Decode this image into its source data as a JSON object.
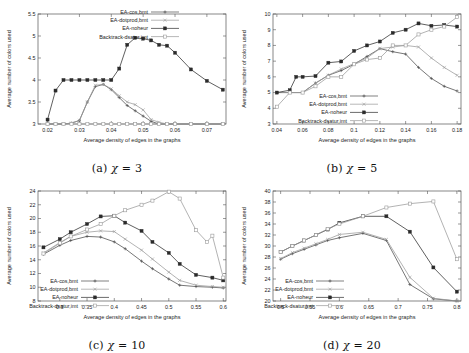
{
  "figure": {
    "panels": [
      {
        "id": "a",
        "caption_prefix": "(a)",
        "caption_chi": "χ",
        "caption_eq": "= 3"
      },
      {
        "id": "b",
        "caption_prefix": "(b)",
        "caption_chi": "χ",
        "caption_eq": "= 5"
      },
      {
        "id": "c",
        "caption_prefix": "(c)",
        "caption_chi": "χ",
        "caption_eq": "= 10"
      },
      {
        "id": "d",
        "caption_prefix": "(d)",
        "caption_chi": "χ",
        "caption_eq": "= 20"
      }
    ]
  },
  "chart_data": [
    {
      "id": "a",
      "type": "line",
      "title": "",
      "xlabel": "Average density of edges in the graphs",
      "ylabel": "Average number of colors used",
      "xlim": [
        0.017,
        0.076
      ],
      "ylim": [
        3,
        5.5
      ],
      "xticks": [
        0.02,
        0.03,
        0.04,
        0.05,
        0.06,
        0.07
      ],
      "xtick_labels": [
        "0.02",
        "0.03",
        "0.04",
        "0.05",
        "0.06",
        "0.07"
      ],
      "yticks": [
        3,
        3.5,
        4,
        4.5,
        5,
        5.5
      ],
      "ytick_labels": [
        "3",
        "3.5",
        "4",
        "4.5",
        "5",
        "5.5"
      ],
      "grid": false,
      "legend_position": "top-right",
      "series": [
        {
          "name": "EA-cos,bmt",
          "marker": "plus",
          "color": "#4a4a4a",
          "x": [
            0.02,
            0.0225,
            0.025,
            0.0275,
            0.03,
            0.0325,
            0.035,
            0.0375,
            0.04,
            0.0425,
            0.045,
            0.0475,
            0.05,
            0.0525,
            0.055,
            0.0575,
            0.06,
            0.065,
            0.07,
            0.075
          ],
          "y": [
            3.0,
            3.0,
            3.0,
            3.02,
            3.08,
            3.5,
            3.85,
            3.9,
            3.78,
            3.6,
            3.42,
            3.3,
            3.18,
            3.06,
            3.0,
            3.0,
            3.0,
            3.0,
            3.0,
            3.0
          ]
        },
        {
          "name": "EA-dotprod,bmt",
          "marker": "cross",
          "color": "#9a9a9a",
          "x": [
            0.02,
            0.0225,
            0.025,
            0.0275,
            0.03,
            0.0325,
            0.035,
            0.0375,
            0.04,
            0.0425,
            0.045,
            0.0475,
            0.05,
            0.0525,
            0.055,
            0.0575,
            0.06,
            0.065,
            0.07,
            0.075
          ],
          "y": [
            3.0,
            3.0,
            3.0,
            3.02,
            3.08,
            3.5,
            3.88,
            3.9,
            3.8,
            3.64,
            3.5,
            3.44,
            3.32,
            3.1,
            3.04,
            3.0,
            3.0,
            3.0,
            3.0,
            3.0
          ]
        },
        {
          "name": "EA-noheur",
          "marker": "filled-square",
          "color": "#2b2b2b",
          "x": [
            0.02,
            0.0225,
            0.025,
            0.0275,
            0.03,
            0.0325,
            0.035,
            0.0375,
            0.04,
            0.0425,
            0.045,
            0.0475,
            0.05,
            0.0525,
            0.055,
            0.0575,
            0.06,
            0.065,
            0.07,
            0.075
          ],
          "y": [
            3.1,
            3.76,
            4.0,
            4.0,
            4.0,
            4.0,
            4.0,
            4.0,
            4.0,
            4.26,
            4.8,
            4.96,
            4.94,
            4.9,
            4.8,
            4.78,
            4.62,
            4.24,
            3.98,
            3.78
          ]
        },
        {
          "name": "Backtrack-dsatur,imt",
          "marker": "open-square",
          "color": "#9a9a9a",
          "x": [
            0.02,
            0.0225,
            0.025,
            0.0275,
            0.03,
            0.0325,
            0.035,
            0.0375,
            0.04,
            0.0425,
            0.045,
            0.0475,
            0.05,
            0.0525,
            0.055,
            0.0575,
            0.06,
            0.065,
            0.07,
            0.075
          ],
          "y": [
            3.0,
            3.0,
            3.0,
            3.0,
            3.0,
            3.0,
            3.0,
            3.0,
            3.0,
            3.0,
            3.0,
            3.0,
            3.0,
            3.0,
            3.0,
            3.0,
            3.0,
            3.0,
            3.0,
            3.0
          ]
        }
      ]
    },
    {
      "id": "b",
      "type": "line",
      "title": "",
      "xlabel": "Average density of edges in the graphs",
      "ylabel": "Average number of colors used",
      "xlim": [
        0.037,
        0.183
      ],
      "ylim": [
        3,
        10
      ],
      "xticks": [
        0.04,
        0.06,
        0.08,
        0.1,
        0.12,
        0.14,
        0.16,
        0.18
      ],
      "xtick_labels": [
        "0.04",
        "0.06",
        "0.08",
        "0.1",
        "0.12",
        "0.14",
        "0.16",
        "0.18"
      ],
      "yticks": [
        3,
        4,
        5,
        6,
        7,
        8,
        9,
        10
      ],
      "ytick_labels": [
        "3",
        "4",
        "5",
        "6",
        "7",
        "8",
        "9",
        "10"
      ],
      "grid": false,
      "legend_position": "bottom-center",
      "series": [
        {
          "name": "EA-cos,bmt",
          "marker": "plus",
          "color": "#4a4a4a",
          "x": [
            0.04,
            0.05,
            0.06,
            0.07,
            0.08,
            0.09,
            0.1,
            0.11,
            0.12,
            0.13,
            0.14,
            0.15,
            0.16,
            0.17,
            0.18
          ],
          "y": [
            5.0,
            5.0,
            5.0,
            5.6,
            6.1,
            6.4,
            6.8,
            7.3,
            7.8,
            7.6,
            7.45,
            6.6,
            5.9,
            5.4,
            5.1
          ]
        },
        {
          "name": "EA-dotprod,bmt",
          "marker": "cross",
          "color": "#9a9a9a",
          "x": [
            0.04,
            0.05,
            0.06,
            0.07,
            0.08,
            0.09,
            0.1,
            0.11,
            0.12,
            0.13,
            0.14,
            0.15,
            0.16,
            0.17,
            0.18
          ],
          "y": [
            5.0,
            5.0,
            5.0,
            5.6,
            6.1,
            6.5,
            6.85,
            7.2,
            7.8,
            7.9,
            8.0,
            7.9,
            7.2,
            6.6,
            6.1
          ]
        },
        {
          "name": "EA-noheur",
          "marker": "filled-square",
          "color": "#2b2b2b",
          "x": [
            0.04,
            0.05,
            0.055,
            0.06,
            0.07,
            0.08,
            0.09,
            0.1,
            0.11,
            0.12,
            0.13,
            0.14,
            0.15,
            0.16,
            0.17,
            0.18
          ],
          "y": [
            5.0,
            5.15,
            6.0,
            6.0,
            6.05,
            6.9,
            6.98,
            7.65,
            8.0,
            8.25,
            8.8,
            9.0,
            9.4,
            9.25,
            9.3,
            9.2
          ]
        },
        {
          "name": "Backtrack-dsatur,imt",
          "marker": "open-square",
          "color": "#9a9a9a",
          "x": [
            0.04,
            0.05,
            0.06,
            0.07,
            0.08,
            0.09,
            0.1,
            0.11,
            0.12,
            0.13,
            0.14,
            0.15,
            0.16,
            0.17,
            0.18
          ],
          "y": [
            4.1,
            5.0,
            5.0,
            5.4,
            6.0,
            6.0,
            6.8,
            7.1,
            7.2,
            8.0,
            8.0,
            8.7,
            9.0,
            9.2,
            9.8
          ]
        }
      ]
    },
    {
      "id": "c",
      "type": "line",
      "title": "",
      "xlabel": "Average density of edges in the graphs",
      "ylabel": "Average number of colors used",
      "xlim": [
        0.26,
        0.605
      ],
      "ylim": [
        8,
        24
      ],
      "xticks": [
        0.3,
        0.35,
        0.4,
        0.45,
        0.5,
        0.55,
        0.6
      ],
      "xtick_labels": [
        "0.3",
        "0.35",
        "0.4",
        "0.45",
        "0.5",
        "0.55",
        "0.6"
      ],
      "yticks": [
        8,
        10,
        12,
        14,
        16,
        18,
        20,
        22,
        24
      ],
      "ytick_labels": [
        "8",
        "10",
        "12",
        "14",
        "16",
        "18",
        "20",
        "22",
        "24"
      ],
      "grid": false,
      "legend_position": "bottom-left",
      "series": [
        {
          "name": "EA-cos,bmt",
          "marker": "plus",
          "color": "#4a4a4a",
          "x": [
            0.27,
            0.3,
            0.32,
            0.35,
            0.375,
            0.4,
            0.42,
            0.45,
            0.47,
            0.5,
            0.52,
            0.55,
            0.58,
            0.6
          ],
          "y": [
            14.8,
            16.1,
            16.8,
            17.4,
            17.3,
            16.6,
            15.6,
            13.8,
            12.7,
            11.2,
            10.3,
            10.1,
            10.0,
            9.9
          ]
        },
        {
          "name": "EA-dotprod,bmt",
          "marker": "cross",
          "color": "#9a9a9a",
          "x": [
            0.27,
            0.3,
            0.32,
            0.35,
            0.375,
            0.4,
            0.42,
            0.45,
            0.47,
            0.5,
            0.52,
            0.55,
            0.58,
            0.6
          ],
          "y": [
            15.0,
            16.5,
            17.4,
            18.0,
            18.2,
            18.1,
            17.0,
            15.4,
            14.1,
            12.2,
            11.0,
            10.3,
            10.1,
            10.0
          ]
        },
        {
          "name": "EA-noheur",
          "marker": "filled-square",
          "color": "#2b2b2b",
          "x": [
            0.27,
            0.3,
            0.32,
            0.35,
            0.375,
            0.4,
            0.42,
            0.45,
            0.47,
            0.5,
            0.52,
            0.55,
            0.58,
            0.6
          ],
          "y": [
            15.8,
            17.0,
            18.0,
            19.2,
            20.3,
            20.4,
            19.4,
            18.2,
            16.6,
            15.0,
            13.4,
            11.8,
            11.4,
            11.0
          ]
        },
        {
          "name": "Backtrack-dsatur,imt",
          "marker": "open-square",
          "color": "#9a9a9a",
          "x": [
            0.27,
            0.3,
            0.32,
            0.35,
            0.375,
            0.4,
            0.42,
            0.45,
            0.47,
            0.5,
            0.52,
            0.55,
            0.57,
            0.58,
            0.6
          ],
          "y": [
            14.9,
            16.4,
            17.4,
            18.4,
            19.2,
            20.4,
            21.2,
            22.0,
            22.6,
            23.9,
            22.9,
            18.3,
            16.6,
            17.5,
            11.4
          ]
        }
      ]
    },
    {
      "id": "d",
      "type": "line",
      "title": "",
      "xlabel": "Average density of edges in the graphs",
      "ylabel": "Average number of colors used",
      "xlim": [
        0.487,
        0.807
      ],
      "ylim": [
        20,
        40
      ],
      "xticks": [
        0.5,
        0.55,
        0.6,
        0.65,
        0.7,
        0.75,
        0.8
      ],
      "xtick_labels": [
        "0.5",
        "0.55",
        "0.6",
        "0.65",
        "0.7",
        "0.75",
        "0.8"
      ],
      "yticks": [
        20,
        22,
        24,
        26,
        28,
        30,
        32,
        34,
        36,
        38,
        40
      ],
      "ytick_labels": [
        "20",
        "22",
        "24",
        "26",
        "28",
        "30",
        "32",
        "34",
        "36",
        "38",
        "40"
      ],
      "grid": false,
      "legend_position": "bottom-left",
      "series": [
        {
          "name": "EA-cos,bmt",
          "marker": "plus",
          "color": "#4a4a4a",
          "x": [
            0.5,
            0.52,
            0.54,
            0.56,
            0.58,
            0.6,
            0.64,
            0.68,
            0.72,
            0.76,
            0.8
          ],
          "y": [
            27.6,
            28.6,
            29.4,
            30.2,
            31.0,
            31.5,
            32.3,
            31.0,
            23.0,
            20.4,
            20.0
          ]
        },
        {
          "name": "EA-dotprod,bmt",
          "marker": "cross",
          "color": "#9a9a9a",
          "x": [
            0.5,
            0.52,
            0.54,
            0.56,
            0.58,
            0.6,
            0.64,
            0.68,
            0.72,
            0.76,
            0.8
          ],
          "y": [
            27.7,
            28.8,
            29.6,
            30.4,
            31.2,
            32.1,
            32.5,
            31.2,
            24.3,
            20.5,
            20.0
          ]
        },
        {
          "name": "EA-noheur",
          "marker": "filled-square",
          "color": "#2b2b2b",
          "x": [
            0.5,
            0.52,
            0.54,
            0.56,
            0.58,
            0.6,
            0.64,
            0.68,
            0.72,
            0.76,
            0.8
          ],
          "y": [
            28.9,
            30.0,
            31.0,
            32.0,
            33.0,
            34.2,
            35.4,
            35.4,
            32.6,
            26.1,
            21.7
          ]
        },
        {
          "name": "Backtrack-dsatur,imt",
          "marker": "open-square",
          "color": "#9a9a9a",
          "x": [
            0.5,
            0.52,
            0.54,
            0.56,
            0.58,
            0.6,
            0.64,
            0.68,
            0.72,
            0.76,
            0.8
          ],
          "y": [
            28.9,
            30.0,
            31.0,
            32.0,
            33.1,
            34.0,
            35.4,
            37.0,
            37.7,
            38.1,
            27.6
          ]
        }
      ]
    }
  ]
}
